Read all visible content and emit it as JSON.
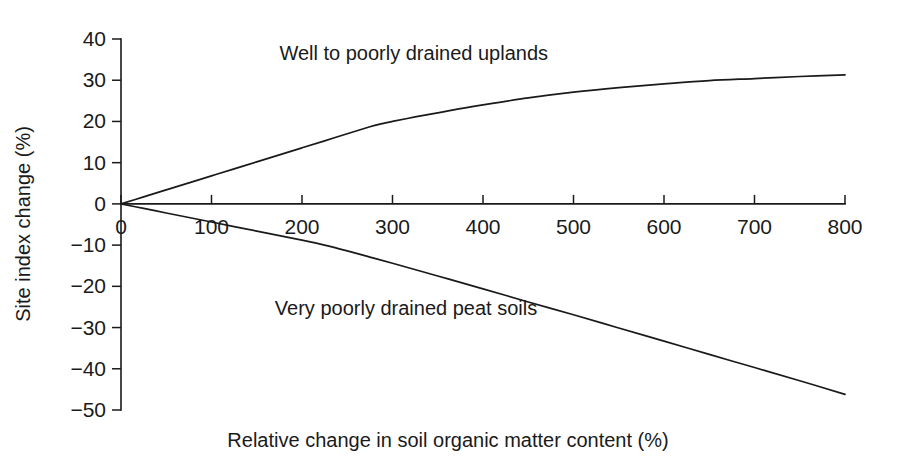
{
  "chart_data": {
    "type": "line",
    "title": "",
    "xlabel": "Relative change in soil organic matter content (%)",
    "ylabel": "Site index change (%)",
    "xlim": [
      0,
      800
    ],
    "ylim": [
      -50,
      40
    ],
    "xticks": [
      0,
      100,
      200,
      300,
      400,
      500,
      600,
      700,
      800
    ],
    "xticklabels": [
      "0",
      "100",
      "200",
      "300",
      "400",
      "500",
      "600",
      "700",
      "800"
    ],
    "yticks": [
      40,
      30,
      20,
      10,
      0,
      -10,
      -20,
      -30,
      -40,
      -50
    ],
    "yticklabels": [
      "40",
      "30",
      "20",
      "10",
      "0",
      "−10",
      "−20",
      "−30",
      "−40",
      "−50"
    ],
    "grid": false,
    "legend_position": "inline-annotation",
    "line_color": "#1a1a1a",
    "background_color": "#ffffff",
    "series": [
      {
        "name": "Well to poorly drained uplands",
        "label_position": {
          "x": 175,
          "y": 35
        },
        "x": [
          0,
          25,
          50,
          75,
          100,
          125,
          150,
          175,
          200,
          225,
          250,
          275,
          285,
          300,
          325,
          350,
          375,
          400,
          450,
          500,
          550,
          600,
          650,
          700,
          750,
          800
        ],
        "values": [
          0,
          1.7,
          3.4,
          5.1,
          6.8,
          8.5,
          10.2,
          11.9,
          13.6,
          15.3,
          17.0,
          18.7,
          19.3,
          20.0,
          21.1,
          22.1,
          23.1,
          24.0,
          25.7,
          27.1,
          28.2,
          29.1,
          29.9,
          30.4,
          30.9,
          31.3
        ]
      },
      {
        "name": "Very poorly drained peat soils",
        "label_position": {
          "x": 170,
          "y": -27
        },
        "x": [
          0,
          25,
          50,
          75,
          100,
          125,
          150,
          175,
          200,
          225,
          250,
          275,
          300,
          350,
          400,
          450,
          500,
          550,
          600,
          650,
          700,
          750,
          800
        ],
        "values": [
          0,
          -1.1,
          -2.2,
          -3.3,
          -4.4,
          -5.5,
          -6.6,
          -7.7,
          -8.8,
          -10.0,
          -11.4,
          -12.9,
          -14.4,
          -17.5,
          -20.6,
          -23.8,
          -26.9,
          -30.1,
          -33.3,
          -36.5,
          -39.7,
          -42.9,
          -46.2
        ]
      }
    ]
  },
  "series_labels": {
    "upper": "Well to poorly drained uplands",
    "lower": "Very poorly drained peat soils"
  },
  "axis": {
    "x_title": "Relative change in soil organic matter content (%)",
    "y_title": "Site index change (%)"
  }
}
